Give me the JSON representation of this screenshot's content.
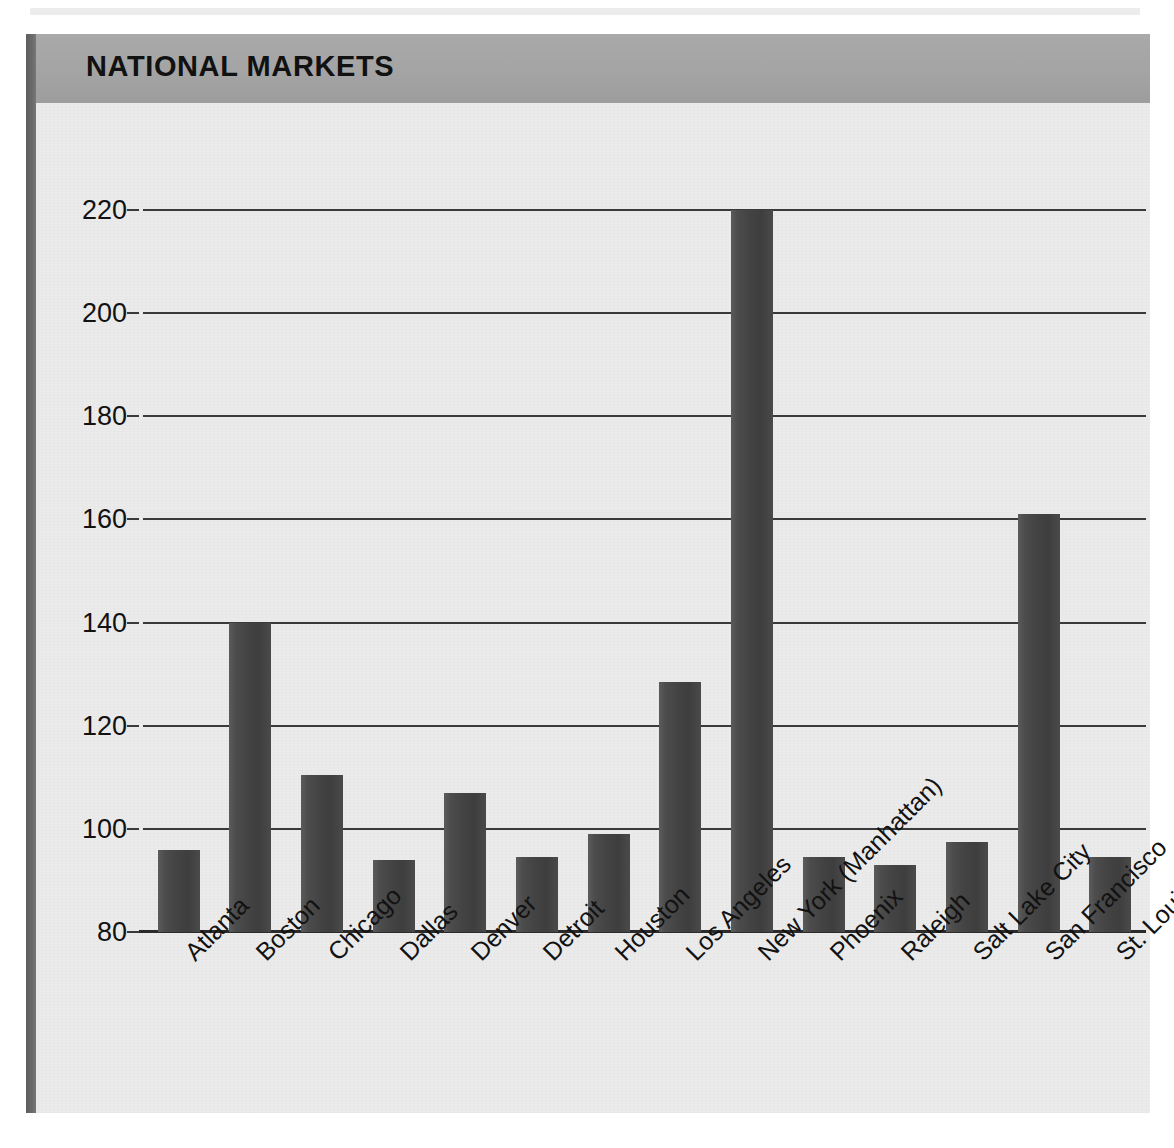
{
  "figure": {
    "title": "NATIONAL MARKETS",
    "accent_bar_color": "#a4a4a4",
    "panel_color": "#ebebeb",
    "bar_color": "#434343",
    "rail_color": "#6a6a6a"
  },
  "chart_data": {
    "type": "bar",
    "title": "NATIONAL MARKETS",
    "xlabel": "",
    "ylabel": "",
    "ylim": [
      80,
      220
    ],
    "ytick_step": 20,
    "yticks": [
      220,
      200,
      180,
      160,
      140,
      120,
      100,
      80
    ],
    "grid": true,
    "legend": "none",
    "categories": [
      "Atlanta",
      "Boston",
      "Chicago",
      "Dallas",
      "Denver",
      "Detroit",
      "Houston",
      "Los Angeles",
      "New York (Manhattan)",
      "Phoenix",
      "Raleigh",
      "Salt Lake City",
      "San Francisco",
      "St. Louis"
    ],
    "values": [
      96,
      140,
      110.5,
      94,
      107,
      94.5,
      99,
      128.5,
      220,
      94.5,
      93,
      97.5,
      161,
      94.5
    ]
  }
}
